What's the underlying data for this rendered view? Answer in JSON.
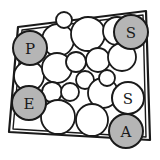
{
  "figure": {
    "background_color": "#ffffff",
    "outline_color": "#1a1a1a",
    "shaded_fill": "#b5b5b5",
    "plain_fill": "#ffffff",
    "container": {
      "name": "quadrilateral-boundary",
      "outer_points": "18,27 146,11 150,140 9,132",
      "inner_points": "22,30 143,15 146,137 13,129",
      "stroke_width": 2.2
    },
    "labeled_circles": [
      {
        "id": "circle-p",
        "label": "P",
        "cx": 30,
        "cy": 48,
        "r": 17,
        "shaded": true
      },
      {
        "id": "circle-s-top",
        "label": "S",
        "cx": 131,
        "cy": 32,
        "r": 17,
        "shaded": true
      },
      {
        "id": "circle-e",
        "label": "E",
        "cx": 29,
        "cy": 103,
        "r": 17,
        "shaded": true
      },
      {
        "id": "circle-s-right",
        "label": "S",
        "cx": 128,
        "cy": 98,
        "r": 16,
        "shaded": false
      },
      {
        "id": "circle-a",
        "label": "A",
        "cx": 126,
        "cy": 131,
        "r": 17,
        "shaded": true
      }
    ],
    "plain_circles": [
      {
        "cx": 58,
        "cy": 40,
        "r": 16
      },
      {
        "cx": 88,
        "cy": 34,
        "r": 17
      },
      {
        "cx": 117,
        "cy": 31,
        "r": 14
      },
      {
        "cx": 29,
        "cy": 76,
        "r": 15
      },
      {
        "cx": 57,
        "cy": 68,
        "r": 15
      },
      {
        "cx": 76,
        "cy": 62,
        "r": 10
      },
      {
        "cx": 98,
        "cy": 60,
        "r": 12
      },
      {
        "cx": 122,
        "cy": 57,
        "r": 14
      },
      {
        "cx": 85,
        "cy": 80,
        "r": 9
      },
      {
        "cx": 52,
        "cy": 92,
        "r": 10
      },
      {
        "cx": 70,
        "cy": 92,
        "r": 9
      },
      {
        "cx": 103,
        "cy": 93,
        "r": 15
      },
      {
        "cx": 58,
        "cy": 117,
        "r": 17
      },
      {
        "cx": 92,
        "cy": 120,
        "r": 16
      },
      {
        "cx": 64,
        "cy": 20,
        "r": 8
      },
      {
        "cx": 107,
        "cy": 78,
        "r": 8
      }
    ]
  }
}
